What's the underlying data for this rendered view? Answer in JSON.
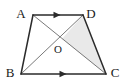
{
  "figure": {
    "kind": "geometry-diagram",
    "shape": "trapezoid",
    "background_color": "#ffffff",
    "stroke_color": "#2b2b2b",
    "diagonal_stroke_color": "#5a5a5a",
    "shaded_fill_color": "#e9e9e9",
    "shaded_region_label": "ODC",
    "vertices": [
      {
        "name": "A",
        "label": "A",
        "x": 33,
        "y": 15,
        "label_x": 21,
        "label_y": 15
      },
      {
        "name": "D",
        "label": "D",
        "x": 83,
        "y": 15,
        "label_x": 88,
        "label_y": 15
      },
      {
        "name": "B",
        "label": "B",
        "x": 21,
        "y": 74,
        "label_x": 9,
        "label_y": 76
      },
      {
        "name": "C",
        "label": "C",
        "x": 106,
        "y": 74,
        "label_x": 110,
        "label_y": 76
      },
      {
        "name": "O",
        "label": "O",
        "x": 62,
        "y": 39,
        "label_x": 56,
        "label_y": 52
      }
    ],
    "sides": [
      {
        "name": "side-AD",
        "from": "A",
        "to": "D",
        "x1": 33,
        "y1": 15,
        "x2": 83,
        "y2": 15,
        "marker": "single-arrow"
      },
      {
        "name": "side-AB",
        "from": "A",
        "to": "B",
        "x1": 33,
        "y1": 15,
        "x2": 21,
        "y2": 74,
        "marker": "none"
      },
      {
        "name": "side-BC",
        "from": "B",
        "to": "C",
        "x1": 21,
        "y1": 74,
        "x2": 106,
        "y2": 74,
        "marker": "single-arrow"
      },
      {
        "name": "side-DC",
        "from": "D",
        "to": "C",
        "x1": 83,
        "y1": 15,
        "x2": 106,
        "y2": 74,
        "marker": "none"
      }
    ],
    "diagonals": [
      {
        "name": "diagonal-AC",
        "from": "A",
        "to": "C",
        "x1": 33,
        "y1": 15,
        "x2": 106,
        "y2": 74
      },
      {
        "name": "diagonal-BD",
        "from": "B",
        "to": "D",
        "x1": 21,
        "y1": 74,
        "x2": 83,
        "y2": 15
      }
    ],
    "parallel_markers": [
      {
        "name": "parallel-marker-ad",
        "x": 57,
        "y": 15,
        "direction": "right"
      },
      {
        "name": "parallel-marker-bc",
        "x": 63,
        "y": 74,
        "direction": "right"
      }
    ],
    "shaded_polygon": {
      "name": "shaded-triangle-odc",
      "points": "62,39 83,15 106,74"
    },
    "relations": "AD parallel to BC; diagonals AC and BD intersect at O"
  }
}
